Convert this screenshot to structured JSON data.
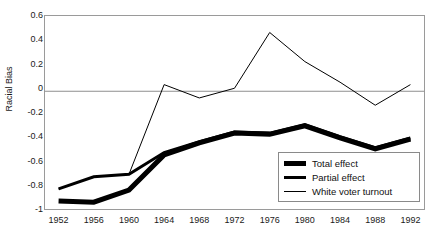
{
  "chart_data": {
    "type": "line",
    "title": "",
    "xlabel": "",
    "ylabel": "Racial Bias",
    "x": [
      1952,
      1956,
      1960,
      1964,
      1968,
      1972,
      1976,
      1980,
      1984,
      1988,
      1992
    ],
    "xticklabels": [
      "1952",
      "1956",
      "1960",
      "1964",
      "1968",
      "1972",
      "1976",
      "1980",
      "1984",
      "1988",
      "1992"
    ],
    "yticklabels": [
      "0.6",
      "0.4",
      "0.2",
      "0",
      "-0.2",
      "-0.4",
      "-0.6",
      "-0.8",
      "-1"
    ],
    "ytickvalues": [
      0.6,
      0.4,
      0.2,
      0,
      -0.2,
      -0.4,
      -0.6,
      -0.8,
      -1
    ],
    "xlim": [
      1950.4,
      1993.6
    ],
    "ylim": [
      -1,
      0.6
    ],
    "grid": false,
    "zero_line": true,
    "legend_position": "lower right",
    "series": [
      {
        "name": "Total effect",
        "linewidth": 5,
        "color": "#000000",
        "values": [
          -0.93,
          -0.94,
          -0.84,
          -0.55,
          -0.45,
          -0.37,
          -0.38,
          -0.31,
          -0.41,
          -0.5,
          -0.42
        ]
      },
      {
        "name": "Partial effect",
        "linewidth": 3,
        "color": "#000000",
        "values": [
          -0.83,
          -0.73,
          -0.71,
          -0.53,
          -0.44,
          -0.36,
          -0.37,
          -0.3,
          -0.4,
          -0.49,
          -0.41
        ]
      },
      {
        "name": "White voter turnout",
        "linewidth": 1,
        "color": "#000000",
        "values": [
          -0.83,
          -0.73,
          -0.71,
          0.03,
          -0.08,
          0.0,
          0.46,
          0.22,
          0.05,
          -0.14,
          0.03
        ]
      }
    ]
  },
  "axis": {
    "ylabel": "Racial Bias",
    "yticks": [
      "0.6",
      "0.4",
      "0.2",
      "0",
      "-0.2",
      "-0.4",
      "-0.6",
      "-0.8",
      "-1"
    ],
    "xticks": [
      "1952",
      "1956",
      "1960",
      "1964",
      "1968",
      "1972",
      "1976",
      "1980",
      "1984",
      "1988",
      "1992"
    ]
  },
  "legend": {
    "items": [
      {
        "label": "Total effect",
        "style": "thick"
      },
      {
        "label": "Partial effect",
        "style": "medium"
      },
      {
        "label": "White voter turnout",
        "style": "thin"
      }
    ]
  }
}
